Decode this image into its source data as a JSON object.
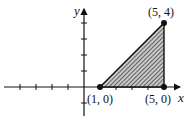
{
  "diagram": {
    "type": "coordinate-plane-region",
    "axes": {
      "x_label": "x",
      "y_label": "y"
    },
    "region": {
      "shape": "triangle",
      "fill": "hatched",
      "vertices": [
        {
          "x": 1,
          "y": 0,
          "label": "(1, 0)"
        },
        {
          "x": 5,
          "y": 0,
          "label": "(5, 0)"
        },
        {
          "x": 5,
          "y": 4,
          "label": "(5, 4)"
        }
      ]
    },
    "ticks": {
      "x": [
        -4,
        -3,
        -2,
        -1,
        1,
        2,
        3,
        4,
        5
      ],
      "y": [
        -1,
        1,
        2,
        3,
        4
      ]
    },
    "colors": {
      "stroke": "#111111",
      "hatch": "#333333",
      "fill_bg": "#bdbdbd"
    }
  }
}
